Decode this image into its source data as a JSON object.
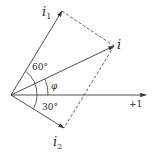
{
  "diagram": {
    "type": "phasor-diagram",
    "colors": {
      "stroke": "#3a3a3a",
      "text": "#2a2a2a",
      "background": "#ffffff"
    },
    "origin": {
      "x": 11,
      "y": 95
    },
    "vectors": [
      {
        "id": "i1",
        "label_main": "i",
        "label_sub": "1",
        "tip": {
          "x": 62,
          "y": 11
        },
        "angle_deg": 60,
        "style": "solid"
      },
      {
        "id": "i",
        "label_main": "i",
        "label_sub": "",
        "tip": {
          "x": 114,
          "y": 46
        },
        "angle_label": "φ",
        "style": "solid"
      },
      {
        "id": "i2",
        "label_main": "i",
        "label_sub": "2",
        "tip": {
          "x": 64,
          "y": 128
        },
        "angle_deg": -30,
        "style": "solid"
      },
      {
        "id": "real-axis",
        "label_main": "+1",
        "tip": {
          "x": 146,
          "y": 95
        },
        "style": "solid"
      }
    ],
    "dashed_lines": [
      {
        "from": "i1",
        "to": "i"
      },
      {
        "from": "i",
        "to": "i2"
      }
    ],
    "angle_labels": {
      "angle_60": "60°",
      "angle_phi": "φ",
      "angle_30": "30°"
    },
    "labels": {
      "i1_main": "i",
      "i1_sub": "1",
      "i_main": "i",
      "i2_main": "i",
      "i2_sub": "2",
      "axis": "+1"
    }
  }
}
